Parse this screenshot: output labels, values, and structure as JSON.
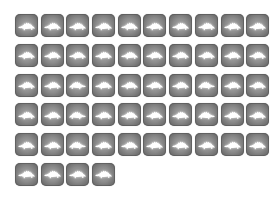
{
  "icon_grid": {
    "columns": 10,
    "tile_color_edge": "#5e5e5e",
    "tile_color_center": "#a8a8a8",
    "glyph_color": "#ffffff",
    "items": [
      {
        "icon": "stegosaurus-icon",
        "facing": "left"
      },
      {
        "icon": "stegosaurus-icon",
        "facing": "left"
      },
      {
        "icon": "stegosaurus-icon",
        "facing": "left"
      },
      {
        "icon": "stegosaurus-icon",
        "facing": "left"
      },
      {
        "icon": "stegosaurus-icon",
        "facing": "left"
      },
      {
        "icon": "stegosaurus-icon",
        "facing": "left"
      },
      {
        "icon": "stegosaurus-icon",
        "facing": "left"
      },
      {
        "icon": "stegosaurus-icon",
        "facing": "left"
      },
      {
        "icon": "stegosaurus-icon",
        "facing": "left"
      },
      {
        "icon": "stegosaurus-icon",
        "facing": "left"
      },
      {
        "icon": "stegosaurus-icon",
        "facing": "left"
      },
      {
        "icon": "stegosaurus-icon",
        "facing": "left"
      },
      {
        "icon": "stegosaurus-icon",
        "facing": "left"
      },
      {
        "icon": "stegosaurus-icon",
        "facing": "left"
      },
      {
        "icon": "stegosaurus-icon",
        "facing": "left"
      },
      {
        "icon": "stegosaurus-icon",
        "facing": "left"
      },
      {
        "icon": "stegosaurus-icon",
        "facing": "left"
      },
      {
        "icon": "stegosaurus-icon",
        "facing": "left"
      },
      {
        "icon": "stegosaurus-icon",
        "facing": "left"
      },
      {
        "icon": "stegosaurus-icon",
        "facing": "left"
      },
      {
        "icon": "stegosaurus-icon",
        "facing": "left"
      },
      {
        "icon": "stegosaurus-icon",
        "facing": "left"
      },
      {
        "icon": "stegosaurus-icon",
        "facing": "right"
      },
      {
        "icon": "stegosaurus-icon",
        "facing": "left"
      },
      {
        "icon": "stegosaurus-icon",
        "facing": "left"
      },
      {
        "icon": "stegosaurus-icon",
        "facing": "left"
      },
      {
        "icon": "stegosaurus-icon",
        "facing": "left"
      },
      {
        "icon": "stegosaurus-icon",
        "facing": "right"
      },
      {
        "icon": "stegosaurus-icon",
        "facing": "left"
      },
      {
        "icon": "stegosaurus-icon",
        "facing": "left"
      },
      {
        "icon": "stegosaurus-icon",
        "facing": "left"
      },
      {
        "icon": "stegosaurus-icon",
        "facing": "left"
      },
      {
        "icon": "stegosaurus-icon",
        "facing": "right"
      },
      {
        "icon": "stegosaurus-icon",
        "facing": "left"
      },
      {
        "icon": "stegosaurus-icon",
        "facing": "left"
      },
      {
        "icon": "stegosaurus-icon",
        "facing": "left"
      },
      {
        "icon": "stegosaurus-icon",
        "facing": "left"
      },
      {
        "icon": "stegosaurus-icon",
        "facing": "right"
      },
      {
        "icon": "stegosaurus-icon",
        "facing": "left"
      },
      {
        "icon": "stegosaurus-icon",
        "facing": "left"
      },
      {
        "icon": "stegosaurus-icon",
        "facing": "left"
      },
      {
        "icon": "stegosaurus-icon",
        "facing": "left"
      },
      {
        "icon": "stegosaurus-icon",
        "facing": "right"
      },
      {
        "icon": "stegosaurus-icon",
        "facing": "left"
      },
      {
        "icon": "stegosaurus-icon",
        "facing": "left"
      },
      {
        "icon": "stegosaurus-icon",
        "facing": "left"
      },
      {
        "icon": "stegosaurus-icon",
        "facing": "left"
      },
      {
        "icon": "stegosaurus-icon",
        "facing": "left"
      },
      {
        "icon": "stegosaurus-icon",
        "facing": "left"
      },
      {
        "icon": "stegosaurus-icon",
        "facing": "left"
      },
      {
        "icon": "stegosaurus-icon",
        "facing": "left"
      },
      {
        "icon": "stegosaurus-icon",
        "facing": "left"
      },
      {
        "icon": "stegosaurus-icon",
        "facing": "left"
      },
      {
        "icon": "stegosaurus-icon",
        "facing": "left"
      }
    ]
  }
}
